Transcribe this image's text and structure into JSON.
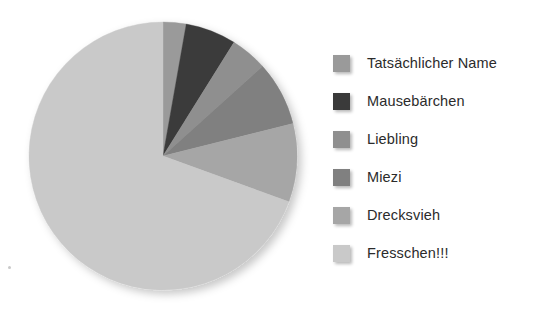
{
  "chart_data": {
    "type": "pie",
    "title": "",
    "subtitle": "",
    "xlabel": "",
    "ylabel": "",
    "legend_position": "right",
    "grid": false,
    "start_angle_deg": 0,
    "direction": "clockwise",
    "categories": [
      "Tatsächlicher Name",
      "Mausebärchen",
      "Liebling",
      "Miezi",
      "Drecksvieh",
      "Fresschen!!!"
    ],
    "values": [
      2.8,
      6.1,
      4.4,
      7.8,
      9.4,
      69.5
    ],
    "angles_deg": [
      10,
      22,
      16,
      28,
      34,
      250
    ],
    "colors": [
      "#9a9a9a",
      "#3a3a3a",
      "#8f8f8f",
      "#808080",
      "#a6a6a6",
      "#c9c9c9"
    ],
    "slices": [
      {
        "label": "Tatsächlicher Name",
        "value": 2.8,
        "angle_deg": 10,
        "color": "#9a9a9a"
      },
      {
        "label": "Mausebärchen",
        "value": 6.1,
        "angle_deg": 22,
        "color": "#3a3a3a"
      },
      {
        "label": "Liebling",
        "value": 4.4,
        "angle_deg": 16,
        "color": "#8f8f8f"
      },
      {
        "label": "Miezi",
        "value": 7.8,
        "angle_deg": 28,
        "color": "#808080"
      },
      {
        "label": "Drecksvieh",
        "value": 9.4,
        "angle_deg": 34,
        "color": "#a6a6a6"
      },
      {
        "label": "Fresschen!!!",
        "value": 69.5,
        "angle_deg": 250,
        "color": "#c9c9c9"
      }
    ]
  },
  "legend": {
    "items": [
      {
        "label": "Tatsächlicher Name",
        "color": "#9a9a9a"
      },
      {
        "label": "Mausebärchen",
        "color": "#3a3a3a"
      },
      {
        "label": "Liebling",
        "color": "#8f8f8f"
      },
      {
        "label": "Miezi",
        "color": "#808080"
      },
      {
        "label": "Drecksvieh",
        "color": "#a6a6a6"
      },
      {
        "label": "Fresschen!!!",
        "color": "#c9c9c9"
      }
    ]
  },
  "pie_geometry": {
    "cx": 163,
    "cy": 156,
    "r": 134
  }
}
